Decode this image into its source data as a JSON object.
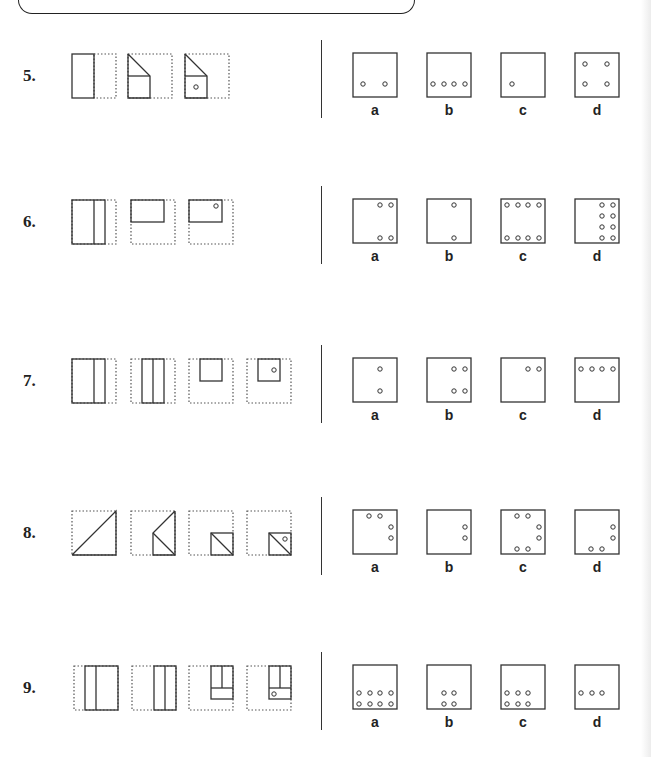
{
  "rows": [
    {
      "number": "5.",
      "top": 40,
      "question_figures": [
        {
          "x": 71,
          "w": 44,
          "type": "fold-left-half"
        },
        {
          "x": 127,
          "w": 44,
          "type": "fold-corner"
        },
        {
          "x": 184,
          "w": 44,
          "type": "fold-corner-punch"
        }
      ],
      "options": [
        {
          "label": "a",
          "holes": [
            [
              10,
              31
            ],
            [
              32,
              31
            ]
          ]
        },
        {
          "label": "b",
          "holes": [
            [
              6,
              31
            ],
            [
              17,
              31
            ],
            [
              27,
              31
            ],
            [
              38,
              31
            ]
          ]
        },
        {
          "label": "c",
          "holes": [
            [
              11,
              31
            ]
          ]
        },
        {
          "label": "d",
          "holes": [
            [
              10,
              11
            ],
            [
              32,
              11
            ],
            [
              10,
              31
            ],
            [
              32,
              31
            ]
          ]
        }
      ]
    },
    {
      "number": "6.",
      "top": 186,
      "question_figures": [
        {
          "x": 71,
          "w": 44,
          "type": "fold-vertical-strip"
        },
        {
          "x": 130,
          "w": 44,
          "type": "fold-top-half"
        },
        {
          "x": 188,
          "w": 44,
          "type": "fold-top-half-punch"
        }
      ],
      "options": [
        {
          "label": "a",
          "holes": [
            [
              27,
              6
            ],
            [
              38,
              6
            ],
            [
              27,
              39
            ],
            [
              38,
              39
            ]
          ]
        },
        {
          "label": "b",
          "holes": [
            [
              27,
              6
            ],
            [
              27,
              39
            ]
          ]
        },
        {
          "label": "c",
          "holes": [
            [
              6,
              6
            ],
            [
              17,
              6
            ],
            [
              27,
              6
            ],
            [
              38,
              6
            ],
            [
              6,
              39
            ],
            [
              17,
              39
            ],
            [
              27,
              39
            ],
            [
              38,
              39
            ]
          ]
        },
        {
          "label": "d",
          "holes": [
            [
              27,
              6
            ],
            [
              38,
              6
            ],
            [
              27,
              17
            ],
            [
              38,
              17
            ],
            [
              27,
              28
            ],
            [
              38,
              28
            ],
            [
              27,
              39
            ],
            [
              38,
              39
            ]
          ]
        }
      ]
    },
    {
      "number": "7.",
      "top": 345,
      "question_figures": [
        {
          "x": 71,
          "w": 44,
          "type": "fold-vertical-strip"
        },
        {
          "x": 130,
          "w": 44,
          "type": "fold-double-strip"
        },
        {
          "x": 188,
          "w": 44,
          "type": "fold-top-right-square"
        },
        {
          "x": 246,
          "w": 44,
          "type": "fold-top-right-square-punch"
        }
      ],
      "options": [
        {
          "label": "a",
          "holes": [
            [
              27,
              11
            ],
            [
              27,
              33
            ]
          ]
        },
        {
          "label": "b",
          "holes": [
            [
              27,
              11
            ],
            [
              38,
              11
            ],
            [
              27,
              33
            ],
            [
              38,
              33
            ]
          ]
        },
        {
          "label": "c",
          "holes": [
            [
              27,
              11
            ],
            [
              38,
              11
            ]
          ]
        },
        {
          "label": "d",
          "holes": [
            [
              6,
              11
            ],
            [
              17,
              11
            ],
            [
              27,
              11
            ],
            [
              38,
              11
            ]
          ]
        }
      ]
    },
    {
      "number": "8.",
      "top": 497,
      "question_figures": [
        {
          "x": 71,
          "w": 44,
          "type": "fold-diagonal"
        },
        {
          "x": 130,
          "w": 44,
          "type": "fold-diagonal-2"
        },
        {
          "x": 188,
          "w": 44,
          "type": "fold-diagonal-3"
        },
        {
          "x": 246,
          "w": 44,
          "type": "fold-diagonal-3-punch"
        }
      ],
      "options": [
        {
          "label": "a",
          "holes": [
            [
              16,
              6
            ],
            [
              27,
              6
            ],
            [
              38,
              17
            ],
            [
              38,
              28
            ]
          ]
        },
        {
          "label": "b",
          "holes": [
            [
              38,
              17
            ],
            [
              38,
              28
            ]
          ]
        },
        {
          "label": "c",
          "holes": [
            [
              16,
              6
            ],
            [
              27,
              6
            ],
            [
              38,
              17
            ],
            [
              38,
              28
            ],
            [
              16,
              39
            ],
            [
              27,
              39
            ]
          ]
        },
        {
          "label": "d",
          "holes": [
            [
              38,
              17
            ],
            [
              38,
              28
            ],
            [
              16,
              39
            ],
            [
              27,
              39
            ]
          ]
        }
      ]
    },
    {
      "number": "9.",
      "top": 652,
      "question_figures": [
        {
          "x": 73,
          "w": 44,
          "type": "fold-left-strip-right"
        },
        {
          "x": 131,
          "w": 44,
          "type": "fold-left-strip-right-2"
        },
        {
          "x": 188,
          "w": 44,
          "type": "fold-bottom-band"
        },
        {
          "x": 246,
          "w": 44,
          "type": "fold-bottom-band-punch"
        }
      ],
      "options": [
        {
          "label": "a",
          "holes": [
            [
              6,
              28
            ],
            [
              17,
              28
            ],
            [
              27,
              28
            ],
            [
              38,
              28
            ],
            [
              6,
              39
            ],
            [
              17,
              39
            ],
            [
              27,
              39
            ],
            [
              38,
              39
            ]
          ]
        },
        {
          "label": "b",
          "holes": [
            [
              17,
              28
            ],
            [
              27,
              28
            ],
            [
              17,
              39
            ],
            [
              27,
              39
            ]
          ]
        },
        {
          "label": "c",
          "holes": [
            [
              6,
              28
            ],
            [
              17,
              28
            ],
            [
              27,
              28
            ],
            [
              6,
              39
            ],
            [
              17,
              39
            ],
            [
              27,
              39
            ]
          ]
        },
        {
          "label": "d",
          "holes": [
            [
              6,
              28
            ],
            [
              17,
              28
            ],
            [
              27,
              28
            ]
          ]
        }
      ]
    }
  ],
  "option_x": [
    352,
    426,
    500,
    574
  ],
  "colors": {
    "line": "#333333",
    "dotted": "#555555",
    "text": "#222222"
  }
}
